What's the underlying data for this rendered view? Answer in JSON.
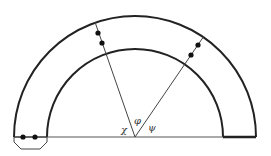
{
  "diagram": {
    "type": "semicircular-annulus-with-radial-lines",
    "angle_labels": {
      "chi": "χ",
      "phi": "φ",
      "psi": "ψ"
    },
    "elements": {
      "outer_arc": "outer semicircle",
      "inner_arc": "inner semicircle",
      "baseline": "horizontal diameter line",
      "left_ray": "radial line with two dots",
      "right_ray": "radial line with two dots",
      "bottom_left_box": "trapezoid with two dots",
      "right_end_cap": "thick closing segment"
    },
    "colors": {
      "stroke": "#222222",
      "background": "#ffffff"
    }
  }
}
